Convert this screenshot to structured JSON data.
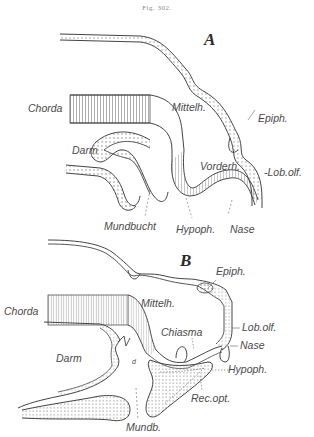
{
  "figure": {
    "caption": "Fig. 302.",
    "colors": {
      "ink": "#3a3a3a",
      "label": "#4a4a4a",
      "stipple": "#9a9a9a",
      "background": "#ffffff"
    }
  },
  "panel_a": {
    "letter": "A",
    "labels": {
      "chorda": "Chorda",
      "darm": "Darm",
      "mittelh": "Mittelh.",
      "epiph": "Epiph.",
      "vorderh": "Vorderh.",
      "lob_olf": "-Lob.olf.",
      "mundbucht": "Mundbucht",
      "hypoph": "Hypoph.",
      "nase": "Nase"
    }
  },
  "panel_b": {
    "letter": "B",
    "labels": {
      "chorda": "Chorda",
      "darm": "Darm",
      "mittelh": "Mittelh.",
      "epiph": "Epiph.",
      "chiasma": "Chiasma",
      "lob_olf": "Lob.olf.",
      "nase": "Nase",
      "hypoph": "Hypoph.",
      "rec_opt": "Rec.opt.",
      "d": "d",
      "mundb": "Mundb."
    }
  }
}
